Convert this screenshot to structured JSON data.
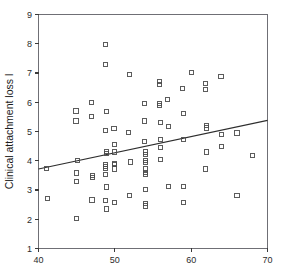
{
  "chart_data": {
    "type": "scatter",
    "title": "",
    "subtitle": "",
    "xlabel": "",
    "ylabel": "Clinical attachment loss l",
    "xlim": [
      40,
      70
    ],
    "ylim": [
      1,
      9
    ],
    "xticks": [
      40,
      50,
      60,
      70
    ],
    "yticks": [
      1,
      2,
      3,
      4,
      5,
      6,
      7,
      8,
      9
    ],
    "xtick_labels": [
      "40",
      "50",
      "60",
      "70"
    ],
    "ytick_labels": [
      "1",
      "2",
      "3",
      "4",
      "5",
      "6",
      "7",
      "8",
      "9"
    ],
    "grid": false,
    "legend": false,
    "legend_position": "none",
    "marker": "open-square",
    "marker_color": "#4a4a4a",
    "line_color": "#2e2e2e",
    "axis_color": "#6f6f75",
    "background": "#ffffff",
    "trendline": {
      "name": "linear fit",
      "x": [
        40,
        70
      ],
      "y": [
        3.72,
        5.38
      ],
      "slope": 0.0553,
      "intercept": 1.51
    },
    "series": [
      {
        "name": "Clinical attachment loss l",
        "points": [
          [
            41.0,
            3.73
          ],
          [
            41.2,
            2.7
          ],
          [
            44.9,
            5.7
          ],
          [
            44.9,
            5.36
          ],
          [
            45.1,
            4.02
          ],
          [
            45.0,
            3.58
          ],
          [
            45.0,
            3.3
          ],
          [
            45.0,
            2.02
          ],
          [
            46.9,
            5.99
          ],
          [
            46.9,
            5.5
          ],
          [
            47.1,
            3.5
          ],
          [
            47.1,
            3.44
          ],
          [
            47.0,
            2.66
          ],
          [
            48.8,
            7.98
          ],
          [
            48.8,
            7.28
          ],
          [
            48.9,
            5.69
          ],
          [
            48.8,
            5.03
          ],
          [
            48.9,
            4.33
          ],
          [
            48.9,
            4.25
          ],
          [
            48.8,
            3.86
          ],
          [
            48.8,
            3.8
          ],
          [
            48.8,
            3.74
          ],
          [
            48.8,
            3.52
          ],
          [
            48.9,
            3.1
          ],
          [
            48.8,
            2.63
          ],
          [
            48.9,
            2.35
          ],
          [
            49.9,
            5.09
          ],
          [
            50.0,
            4.56
          ],
          [
            50.0,
            4.3
          ],
          [
            50.0,
            3.9
          ],
          [
            50.0,
            3.86
          ],
          [
            50.0,
            3.72
          ],
          [
            50.0,
            2.58
          ],
          [
            51.9,
            6.95
          ],
          [
            51.8,
            4.97
          ],
          [
            52.0,
            3.96
          ],
          [
            51.9,
            2.81
          ],
          [
            53.9,
            5.95
          ],
          [
            53.9,
            5.36
          ],
          [
            53.9,
            4.67
          ],
          [
            54.0,
            4.3
          ],
          [
            54.0,
            4.22
          ],
          [
            54.0,
            4.02
          ],
          [
            54.0,
            3.95
          ],
          [
            54.0,
            3.72
          ],
          [
            54.0,
            3.6
          ],
          [
            54.0,
            3.52
          ],
          [
            54.0,
            3.02
          ],
          [
            54.0,
            2.55
          ],
          [
            54.0,
            2.45
          ],
          [
            55.9,
            6.72
          ],
          [
            55.9,
            6.62
          ],
          [
            55.9,
            5.95
          ],
          [
            55.9,
            5.88
          ],
          [
            56.0,
            5.32
          ],
          [
            56.0,
            4.72
          ],
          [
            56.0,
            4.44
          ],
          [
            56.0,
            4.05
          ],
          [
            56.9,
            6.1
          ],
          [
            57.0,
            5.18
          ],
          [
            57.0,
            3.13
          ],
          [
            58.9,
            6.48
          ],
          [
            59.0,
            5.62
          ],
          [
            59.0,
            4.72
          ],
          [
            59.0,
            3.12
          ],
          [
            59.0,
            2.57
          ],
          [
            60.0,
            7.01
          ],
          [
            61.9,
            6.63
          ],
          [
            61.9,
            6.43
          ],
          [
            62.0,
            5.2
          ],
          [
            62.0,
            5.12
          ],
          [
            62.0,
            4.3
          ],
          [
            61.9,
            3.72
          ],
          [
            63.9,
            6.87
          ],
          [
            64.0,
            4.91
          ],
          [
            64.0,
            4.48
          ],
          [
            66.0,
            4.95
          ],
          [
            66.0,
            2.8
          ],
          [
            68.0,
            4.18
          ]
        ]
      }
    ]
  }
}
